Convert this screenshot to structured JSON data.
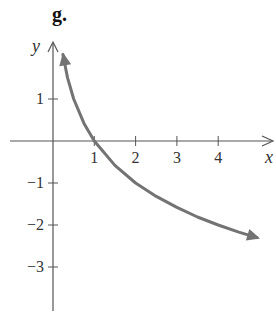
{
  "panel_label": "g.",
  "colors": {
    "axis": "#555555",
    "curve": "#737373",
    "text": "#333333"
  },
  "chart_data": {
    "type": "line",
    "title": "g.",
    "xlabel": "x",
    "ylabel": "y",
    "x_ticks": [
      1,
      2,
      3,
      4
    ],
    "y_ticks": [
      1,
      -1,
      -2,
      -3
    ],
    "x_tick_labels": [
      "1",
      "2",
      "3",
      "4"
    ],
    "y_tick_labels": [
      "1",
      "−1",
      "−2",
      "−3"
    ],
    "xlim": [
      -1.1,
      5.3
    ],
    "ylim": [
      -4,
      2.3
    ],
    "grid": false,
    "legend": null,
    "function": "y = -log2(x)",
    "arrows_both_ends": true,
    "series": [
      {
        "name": "curve",
        "x": [
          0.24,
          0.35,
          0.5,
          0.75,
          1,
          1.5,
          2,
          2.5,
          3,
          3.5,
          4,
          4.5,
          4.94
        ],
        "y": [
          2.06,
          1.51,
          1.0,
          0.42,
          0.0,
          -0.58,
          -1.0,
          -1.32,
          -1.58,
          -1.81,
          -2.0,
          -2.17,
          -2.3
        ]
      }
    ]
  }
}
